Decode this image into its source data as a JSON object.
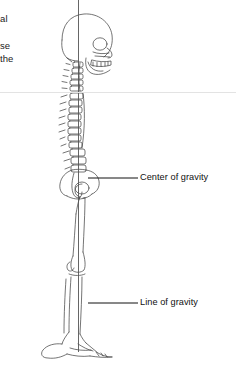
{
  "figure": {
    "name": "lateral-skeleton-posture-diagram",
    "background_color": "#ffffff",
    "line_color": "#3a3a3a",
    "plumb_line_color": "#555555",
    "divider_color": "#e3e3e3",
    "view": "lateral"
  },
  "text_fragments": [
    {
      "id": "frag-1",
      "text": "al"
    },
    {
      "id": "frag-2",
      "text": "se"
    },
    {
      "id": "frag-3",
      "text": "the"
    }
  ],
  "callouts": [
    {
      "id": "center-of-gravity",
      "label": "Center of gravity",
      "leader_from_x": 88,
      "leader_from_y": 178,
      "leader_to_x": 138,
      "leader_to_y": 178
    },
    {
      "id": "line-of-gravity",
      "label": "Line of gravity",
      "leader_from_x": 88,
      "leader_from_y": 303,
      "leader_to_x": 138,
      "leader_to_y": 303
    }
  ],
  "plumb_line": {
    "name": "line-of-gravity-plumb-line",
    "x": 78.5,
    "y_top": 0,
    "y_bottom": 352
  },
  "skeleton_parts": [
    "cranium",
    "facial-bones",
    "mandible",
    "cervical-spine",
    "thoracic-spine",
    "lumbar-spine",
    "sacrum",
    "pelvis",
    "femur",
    "patella",
    "tibia",
    "fibula",
    "foot"
  ]
}
